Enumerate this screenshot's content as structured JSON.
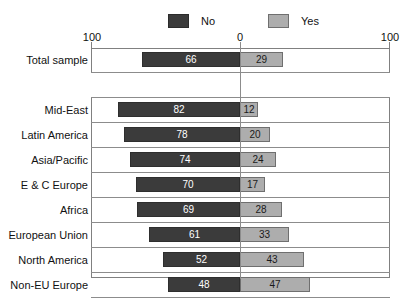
{
  "chart_data": {
    "type": "bar",
    "orientation": "horizontal",
    "subtype": "diverging-bidirectional",
    "title": "",
    "subtitle": "",
    "xlabel": "",
    "ylabel": "",
    "grid": true,
    "legend_position": "top-center",
    "axis": {
      "left_tick_label": "100",
      "center_tick_label": "0",
      "right_tick_label": "100",
      "left_max": 100,
      "right_max": 100,
      "ticks": [
        100,
        0,
        100
      ]
    },
    "legend": [
      {
        "name": "No",
        "color": "#3b3b3b"
      },
      {
        "name": "Yes",
        "color": "#adadad"
      }
    ],
    "categories": [
      "Total sample",
      "Mid-East",
      "Latin America",
      "Asia/Pacific",
      "E & C Europe",
      "Africa",
      "European Union",
      "North America",
      "Non-EU Europe"
    ],
    "series": [
      {
        "name": "No",
        "direction": "left",
        "color": "#3b3b3b",
        "values": [
          66,
          82,
          78,
          74,
          70,
          69,
          61,
          52,
          48
        ]
      },
      {
        "name": "Yes",
        "direction": "right",
        "color": "#adadad",
        "values": [
          29,
          12,
          20,
          24,
          17,
          28,
          33,
          43,
          47
        ]
      }
    ],
    "rows": [
      {
        "label": "Total sample",
        "no": 66,
        "yes": 29,
        "no_text": "66",
        "yes_text": "29"
      },
      {
        "label": "Mid-East",
        "no": 82,
        "yes": 12,
        "no_text": "82",
        "yes_text": "12"
      },
      {
        "label": "Latin America",
        "no": 78,
        "yes": 20,
        "no_text": "78",
        "yes_text": "20"
      },
      {
        "label": "Asia/Pacific",
        "no": 74,
        "yes": 24,
        "no_text": "74",
        "yes_text": "24"
      },
      {
        "label": "E & C Europe",
        "no": 70,
        "yes": 17,
        "no_text": "70",
        "yes_text": "17"
      },
      {
        "label": "Africa",
        "no": 69,
        "yes": 28,
        "no_text": "69",
        "yes_text": "28"
      },
      {
        "label": "European Union",
        "no": 61,
        "yes": 33,
        "no_text": "61",
        "yes_text": "33"
      },
      {
        "label": "North America",
        "no": 52,
        "yes": 43,
        "no_text": "52",
        "yes_text": "43"
      },
      {
        "label": "Non-EU Europe",
        "no": 48,
        "yes": 47,
        "no_text": "48",
        "yes_text": "47"
      }
    ]
  },
  "colors": {
    "no_bar": "#3b3b3b",
    "yes_bar": "#adadad",
    "grid": "#8c8c8c",
    "frame": "#808080",
    "background": "#ffffff",
    "text": "#111111"
  }
}
